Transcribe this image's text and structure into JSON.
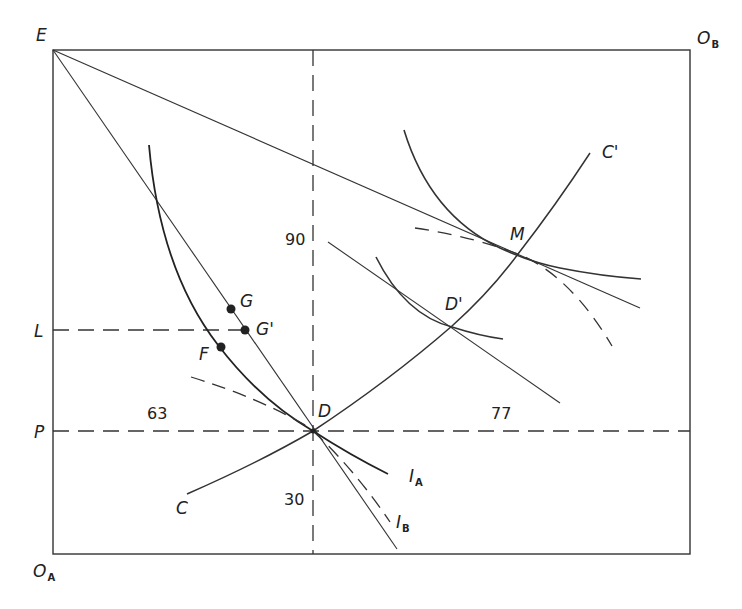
{
  "diagram": {
    "type": "edgeworth-box",
    "corners": {
      "top_left": "E",
      "top_right": "O",
      "top_right_sub": "B",
      "bottom_left": "O",
      "bottom_left_sub": "A"
    },
    "axis_labels": {
      "L": "L",
      "P": "P"
    },
    "numbers": {
      "upper_vertical": "90",
      "lower_vertical": "30",
      "left_horizontal": "63",
      "right_horizontal": "77"
    },
    "points": {
      "D": "D",
      "D_prime": "D'",
      "M": "M",
      "G": "G",
      "G_prime": "G'",
      "F": "F"
    },
    "curves": {
      "C": "C",
      "C_prime": "C'",
      "I_A": "I",
      "I_A_sub": "A",
      "I_B": "I",
      "I_B_sub": "B"
    }
  }
}
